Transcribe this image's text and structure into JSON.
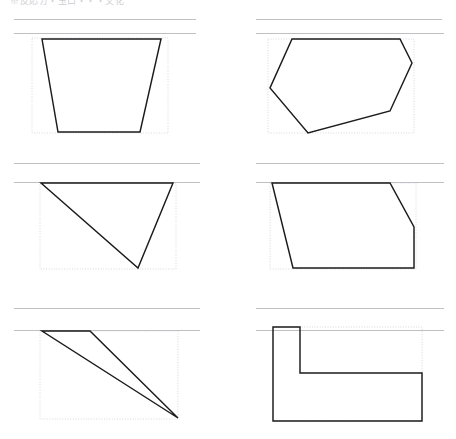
{
  "document": {
    "title": "Geometry Figures Worksheet",
    "header_text": "※反応ガ・玉口・・・文化",
    "page_width": 456,
    "page_height": 439,
    "background_color": "#ffffff",
    "shape_stroke_color": "#1b1b1b",
    "bbox_stroke_color": "#cfcfd4",
    "rule_color": "#bfbfc4"
  },
  "layout": {
    "columns": 2,
    "rows": 3,
    "panel_count": 6
  },
  "rules": [
    {
      "name": "rule-row1-left",
      "x1": 14,
      "y1": 19,
      "x2": 196,
      "y2": 19,
      "weight": "light"
    },
    {
      "name": "rule-row1-right",
      "x1": 256,
      "y1": 19,
      "x2": 442,
      "y2": 19,
      "weight": "light"
    },
    {
      "name": "rule-row1-left-lower",
      "x1": 14,
      "y1": 33,
      "x2": 196,
      "y2": 33,
      "weight": "light"
    },
    {
      "name": "rule-row1-right-lower",
      "x1": 256,
      "y1": 33,
      "x2": 444,
      "y2": 33,
      "weight": "light"
    },
    {
      "name": "rule-row2-left",
      "x1": 14,
      "y1": 163,
      "x2": 200,
      "y2": 163,
      "weight": "light"
    },
    {
      "name": "rule-row2-right",
      "x1": 256,
      "y1": 163,
      "x2": 444,
      "y2": 163,
      "weight": "light"
    },
    {
      "name": "rule-row2-left-lower",
      "x1": 14,
      "y1": 182,
      "x2": 200,
      "y2": 182,
      "weight": "light"
    },
    {
      "name": "rule-row2-right-lower",
      "x1": 256,
      "y1": 182,
      "x2": 444,
      "y2": 182,
      "weight": "light"
    },
    {
      "name": "rule-row3-left",
      "x1": 14,
      "y1": 308,
      "x2": 200,
      "y2": 308,
      "weight": "light"
    },
    {
      "name": "rule-row3-right",
      "x1": 256,
      "y1": 308,
      "x2": 444,
      "y2": 308,
      "weight": "light"
    },
    {
      "name": "rule-row3-left-lower",
      "x1": 14,
      "y1": 330,
      "x2": 200,
      "y2": 330,
      "weight": "light"
    },
    {
      "name": "rule-row3-right-lower",
      "x1": 256,
      "y1": 330,
      "x2": 444,
      "y2": 330,
      "weight": "light"
    }
  ],
  "panels": [
    {
      "id": "panel-1",
      "position": "top-left",
      "shape_name": "trapezoid",
      "vertex_count": 4,
      "bbox": {
        "x": 32,
        "y": 38,
        "width": 136,
        "height": 95
      },
      "points": "42,39 161,39 140,132 58,132"
    },
    {
      "id": "panel-2",
      "position": "top-right",
      "shape_name": "hexagon",
      "vertex_count": 6,
      "bbox": {
        "x": 268,
        "y": 39,
        "width": 146,
        "height": 94
      },
      "points": "292,39 400,39 412,63 390,111 308,133 270,88"
    },
    {
      "id": "panel-3",
      "position": "middle-left",
      "shape_name": "triangle-down",
      "vertex_count": 3,
      "bbox": {
        "x": 40,
        "y": 183,
        "width": 136,
        "height": 86
      },
      "points": "41,183 173,183 138,268"
    },
    {
      "id": "panel-4",
      "position": "middle-right",
      "shape_name": "clipped-parallelogram",
      "vertex_count": 5,
      "bbox": {
        "x": 270,
        "y": 183,
        "width": 146,
        "height": 86
      },
      "points": "272,183 390,183 414,227 414,268 293,268"
    },
    {
      "id": "panel-5",
      "position": "bottom-left",
      "shape_name": "narrow-triangle",
      "vertex_count": 3,
      "bbox": {
        "x": 40,
        "y": 331,
        "width": 138,
        "height": 88
      },
      "points": "42,331 90,331 178,418"
    },
    {
      "id": "panel-6",
      "position": "bottom-right",
      "shape_name": "L-shape",
      "vertex_count": 6,
      "bbox": {
        "x": 273,
        "y": 327,
        "width": 149,
        "height": 94
      },
      "points": "273,327 300,327 300,373 422,373 422,421 273,421"
    }
  ]
}
